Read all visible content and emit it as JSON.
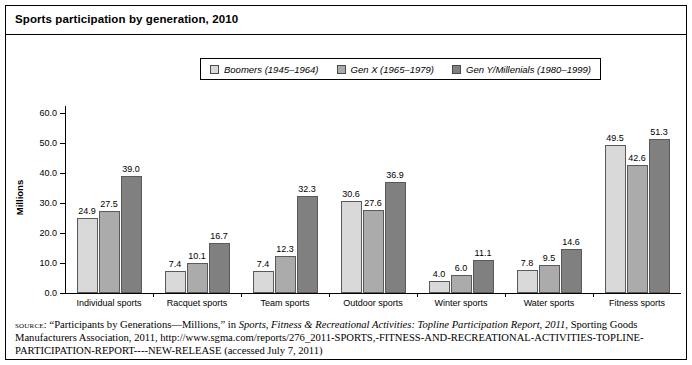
{
  "figure": {
    "title": "Sports participation by generation, 2010"
  },
  "legend": {
    "items": [
      {
        "label": "Boomers (1945–1964)",
        "color": "#d9d9d9",
        "key": "boomers"
      },
      {
        "label": "Gen X (1965–1979)",
        "color": "#ababab",
        "key": "genx"
      },
      {
        "label": "Gen Y/Millenials (1980–1999)",
        "color": "#808080",
        "key": "geny"
      }
    ]
  },
  "axes": {
    "ylabel": "Millions",
    "yticks": [
      "0.0",
      "10.0",
      "20.0",
      "30.0",
      "40.0",
      "50.0",
      "60.0"
    ]
  },
  "source": {
    "kicker": "source:",
    "part1": " “Participants by Generations—Millions,” in ",
    "italic1": "Sports, Fitness & Recreational Activities: Topline Participation Report, 2011",
    "part2": ", Sporting Goods Manufacturers Association, 2011, http://www.sgma.com/reports/276_2011-SPORTS,-FITNESS-AND-RECREATIONAL-ACTIVITIES-TOPLINE-PARTICIPATION-REPORT----NEW-RELEASE (accessed July 7, 2011)"
  },
  "chart_data": {
    "type": "bar",
    "title": "Sports participation by generation, 2010",
    "xlabel": "",
    "ylabel": "Millions",
    "ylim": [
      0,
      60
    ],
    "ytick_step": 10,
    "grid": false,
    "legend_position": "top-center",
    "categories": [
      "Individual sports",
      "Racquet sports",
      "Team sports",
      "Outdoor sports",
      "Winter sports",
      "Water sports",
      "Fitness sports"
    ],
    "series": [
      {
        "name": "Boomers (1945–1964)",
        "color": "#d9d9d9",
        "values": [
          24.9,
          7.4,
          7.4,
          30.6,
          4.0,
          7.8,
          49.5
        ],
        "labels": [
          "24.9",
          "7.4",
          "7.4",
          "30.6",
          "4.0",
          "7.8",
          "49.5"
        ]
      },
      {
        "name": "Gen X (1965–1979)",
        "color": "#ababab",
        "values": [
          27.5,
          10.1,
          12.3,
          27.6,
          6.0,
          9.5,
          42.6
        ],
        "labels": [
          "27.5",
          "10.1",
          "12.3",
          "27.6",
          "6.0",
          "9.5",
          "42.6"
        ]
      },
      {
        "name": "Gen Y/Millenials (1980–1999)",
        "color": "#808080",
        "values": [
          39.0,
          16.7,
          32.3,
          36.9,
          11.1,
          14.6,
          51.3
        ],
        "labels": [
          "39.0",
          "16.7",
          "32.3",
          "36.9",
          "11.1",
          "14.6",
          "51.3"
        ]
      }
    ]
  }
}
